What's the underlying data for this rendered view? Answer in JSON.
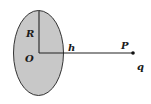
{
  "figure": {
    "labels": {
      "radius": "R",
      "center": "O",
      "distance": "h",
      "point": "P",
      "charge": "q"
    },
    "colors": {
      "disk_fill": "#c8c8c8",
      "stroke": "#333333",
      "background": "#ffffff"
    }
  }
}
